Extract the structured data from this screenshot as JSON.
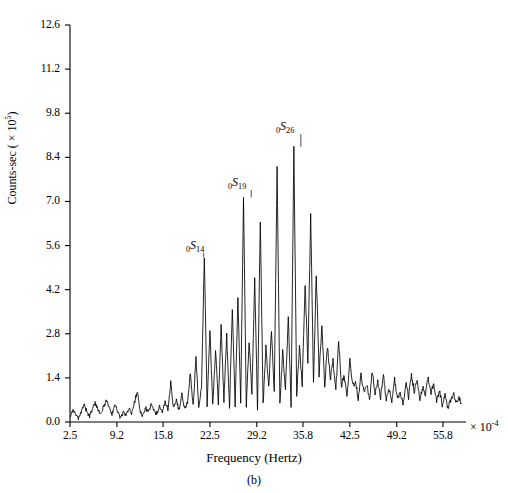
{
  "figure": {
    "caption": "(b)",
    "x_multiplier": "× 10",
    "x_multiplier_exp": "-4"
  },
  "axes": {
    "xlabel": "Frequency (Hertz)",
    "ylabel_main": "Counts-sec ( × 10",
    "ylabel_exp": "5",
    "ylabel_close": ")",
    "xticks": [
      "2.5",
      "9.2",
      "15.8",
      "22.5",
      "29.2",
      "35.8",
      "42.5",
      "49.2",
      "55.8"
    ],
    "yticks": [
      "0.0",
      "1.4",
      "2.8",
      "4.2",
      "5.6",
      "7.0",
      "8.4",
      "9.8",
      "11.2",
      "12.6"
    ]
  },
  "annotations": [
    {
      "name": "mode-0S14",
      "prefix": "0",
      "symbol": "S",
      "order": "14",
      "x_px": 186,
      "y_px": 238
    },
    {
      "name": "mode-0S19",
      "prefix": "0",
      "symbol": "S",
      "order": "19",
      "x_px": 228,
      "y_px": 175
    },
    {
      "name": "mode-0S26",
      "prefix": "0",
      "symbol": "S",
      "order": "26",
      "x_px": 276,
      "y_px": 119
    }
  ],
  "chart_data": {
    "type": "line",
    "title": "",
    "subtitle": "",
    "xlabel": "Frequency (Hertz)",
    "ylabel": "Counts-sec ( × 10^5)",
    "x_scale_factor": 0.0001,
    "y_scale_factor": 100000.0,
    "xlim": [
      2.5,
      59.1
    ],
    "ylim": [
      0.0,
      12.6
    ],
    "xtick_values": [
      2.5,
      9.2,
      15.8,
      22.5,
      29.2,
      35.8,
      42.5,
      49.2,
      55.8
    ],
    "ytick_values": [
      0.0,
      1.4,
      2.8,
      4.2,
      5.6,
      7.0,
      8.4,
      9.8,
      11.2,
      12.6
    ],
    "grid": false,
    "legend": null,
    "series_name": "spectral amplitude",
    "annotations": [
      {
        "label": "0S14",
        "x": 21.6,
        "y": 5.2
      },
      {
        "label": "0S19",
        "x": 28.4,
        "y": 7.1
      },
      {
        "label": "0S26",
        "x": 35.5,
        "y": 8.7
      }
    ],
    "x": [
      2.5,
      2.9,
      3.3,
      3.7,
      4.1,
      4.5,
      4.9,
      5.3,
      5.7,
      6.1,
      6.5,
      6.9,
      7.3,
      7.7,
      8.1,
      8.5,
      8.9,
      9.3,
      9.7,
      10.1,
      10.5,
      10.9,
      11.3,
      11.7,
      12.1,
      12.5,
      12.9,
      13.3,
      13.7,
      14.1,
      14.5,
      14.9,
      15.3,
      15.7,
      16.1,
      16.5,
      16.9,
      17.3,
      17.7,
      18.1,
      18.5,
      18.9,
      19.3,
      19.7,
      20.1,
      20.5,
      20.9,
      21.3,
      21.7,
      22.1,
      22.5,
      22.9,
      23.3,
      23.7,
      24.1,
      24.5,
      24.9,
      25.3,
      25.7,
      26.1,
      26.5,
      26.9,
      27.3,
      27.7,
      28.1,
      28.5,
      28.9,
      29.3,
      29.7,
      30.1,
      30.5,
      30.9,
      31.3,
      31.7,
      32.1,
      32.5,
      32.9,
      33.3,
      33.7,
      34.1,
      34.5,
      34.9,
      35.3,
      35.7,
      36.1,
      36.5,
      36.9,
      37.3,
      37.7,
      38.1,
      38.5,
      38.9,
      39.3,
      39.7,
      40.1,
      40.5,
      40.9,
      41.3,
      41.7,
      42.1,
      42.5,
      42.9,
      43.3,
      43.7,
      44.1,
      44.5,
      44.9,
      45.3,
      45.7,
      46.1,
      46.5,
      46.9,
      47.3,
      47.7,
      48.1,
      48.5,
      48.9,
      49.3,
      49.7,
      50.1,
      50.5,
      50.9,
      51.3,
      51.7,
      52.1,
      52.5,
      52.9,
      53.3,
      53.7,
      54.1,
      54.5,
      54.9,
      55.3,
      55.7,
      56.1,
      56.5,
      56.9,
      57.3,
      57.7,
      58.1,
      58.5,
      58.9
    ],
    "y": [
      0.18,
      0.4,
      0.22,
      0.1,
      0.3,
      0.55,
      0.33,
      0.18,
      0.42,
      0.62,
      0.38,
      0.22,
      0.5,
      0.7,
      0.45,
      0.25,
      0.55,
      0.35,
      0.12,
      0.3,
      0.2,
      0.45,
      0.25,
      0.6,
      1.0,
      0.35,
      0.2,
      0.45,
      0.3,
      0.55,
      0.35,
      0.25,
      0.5,
      0.3,
      0.65,
      0.4,
      1.25,
      0.45,
      0.7,
      0.35,
      0.9,
      0.4,
      0.6,
      1.6,
      0.5,
      2.05,
      0.45,
      1.1,
      5.2,
      0.55,
      2.95,
      0.5,
      2.3,
      0.6,
      3.05,
      0.7,
      2.75,
      0.45,
      3.6,
      0.55,
      3.95,
      0.6,
      7.1,
      0.5,
      2.6,
      0.85,
      4.55,
      0.4,
      6.4,
      0.55,
      2.35,
      1.1,
      2.95,
      0.95,
      8.05,
      0.6,
      2.2,
      1.05,
      3.35,
      0.5,
      8.7,
      0.85,
      2.35,
      1.2,
      4.4,
      1.9,
      6.55,
      1.25,
      4.75,
      1.55,
      3.05,
      1.1,
      2.45,
      1.35,
      1.95,
      1.05,
      2.55,
      1.2,
      1.45,
      0.85,
      2.05,
      1.15,
      1.3,
      0.75,
      1.55,
      0.95,
      1.2,
      0.7,
      1.6,
      0.9,
      1.25,
      0.8,
      1.45,
      0.7,
      1.05,
      0.6,
      1.35,
      0.75,
      0.95,
      0.55,
      1.25,
      0.8,
      1.5,
      0.95,
      1.3,
      0.7,
      1.1,
      0.85,
      1.45,
      0.9,
      1.2,
      0.65,
      1.0,
      0.55,
      0.85,
      0.45,
      0.7,
      0.95,
      0.6,
      0.8,
      0.5
    ]
  }
}
